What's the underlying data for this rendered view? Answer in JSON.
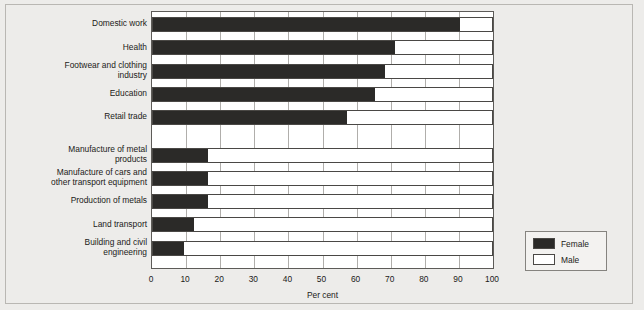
{
  "chart_data": {
    "type": "bar",
    "orientation": "horizontal",
    "stacked": true,
    "title": "",
    "xlabel": "Per cent",
    "ylabel": "",
    "xlim": [
      0,
      100
    ],
    "xticks": [
      0,
      10,
      20,
      30,
      40,
      50,
      60,
      70,
      80,
      90,
      100
    ],
    "grid": true,
    "legend_position": "bottom-right",
    "categories": [
      "Domestic work",
      "Health",
      "Footwear and clothing\nindustry",
      "Education",
      "Retail trade",
      "Manufacture of metal\nproducts",
      "Manufacture of cars and\nother transport equipment",
      "Production of metals",
      "Land transport",
      "Building and civil\nengineering"
    ],
    "series": [
      {
        "name": "Female",
        "color": "#2b2a28",
        "values": [
          90,
          71,
          68,
          65,
          57,
          16,
          16,
          16,
          12,
          9
        ]
      },
      {
        "name": "Male",
        "color": "#ffffff",
        "values": [
          10,
          29,
          32,
          35,
          43,
          84,
          84,
          84,
          88,
          91
        ]
      }
    ]
  },
  "legend": {
    "items": [
      {
        "label": "Female",
        "swatch": "#2b2a28"
      },
      {
        "label": "Male",
        "swatch": "#ffffff"
      }
    ]
  },
  "axis": {
    "tick_labels": [
      "0",
      "10",
      "20",
      "30",
      "40",
      "50",
      "60",
      "70",
      "80",
      "90",
      "100"
    ],
    "title": "Per cent"
  },
  "colors": {
    "background": "#edecea",
    "plot_background": "#ffffff",
    "frame_border": "#b9b7b3",
    "axis_line": "#5d5b58",
    "gridline": "#b0aeab",
    "female": "#2b2a28",
    "male": "#ffffff"
  }
}
